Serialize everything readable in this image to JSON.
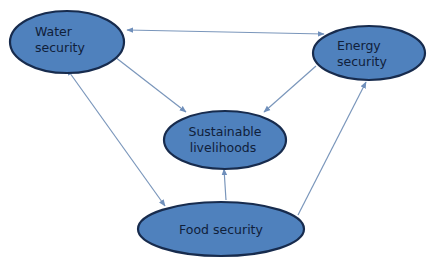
{
  "colors": {
    "node_fill": "#4f81bd",
    "node_stroke": "#172b4d",
    "edge": "#7a96bb",
    "text": "#10203a",
    "background": "#ffffff"
  },
  "nodes": [
    {
      "id": "water",
      "lines": [
        "Water",
        "security"
      ]
    },
    {
      "id": "energy",
      "lines": [
        "Energy",
        "security"
      ]
    },
    {
      "id": "livelihoods",
      "lines": [
        "Sustainable",
        "livelihoods"
      ]
    },
    {
      "id": "food",
      "lines": [
        "Food security"
      ]
    }
  ],
  "edges": [
    {
      "from": "water",
      "to": "energy",
      "direction": "both"
    },
    {
      "from": "water",
      "to": "livelihoods",
      "direction": "forward"
    },
    {
      "from": "energy",
      "to": "livelihoods",
      "direction": "forward"
    },
    {
      "from": "water",
      "to": "food",
      "direction": "both"
    },
    {
      "from": "food",
      "to": "livelihoods",
      "direction": "forward"
    },
    {
      "from": "food",
      "to": "energy",
      "direction": "forward"
    }
  ]
}
